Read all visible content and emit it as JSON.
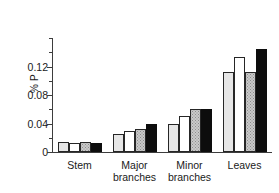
{
  "chart_data": {
    "type": "bar",
    "title": "",
    "xlabel": "",
    "ylabel": "% P",
    "ylim": [
      0,
      0.16
    ],
    "grid": false,
    "legend": "none",
    "categories": [
      "Stem",
      "Major\nbranches",
      "Minor\nbranches",
      "Leaves"
    ],
    "ytick_labels": [
      "0",
      "0.04",
      "0.08",
      "0.12"
    ],
    "ytick_values": [
      0,
      0.04,
      0.08,
      0.12
    ],
    "yminor_values": [
      0.02,
      0.06,
      0.1,
      0.14,
      0.16
    ],
    "series": [
      {
        "name": "series-1",
        "color": "#e6e6e6",
        "fill": "light-gray",
        "values": [
          0.014,
          0.025,
          0.04,
          0.112
        ]
      },
      {
        "name": "series-2",
        "color": "#ffffff",
        "fill": "white",
        "values": [
          0.012,
          0.029,
          0.05,
          0.134
        ]
      },
      {
        "name": "series-3",
        "color": "#c9c9c9",
        "fill": "stipple",
        "values": [
          0.014,
          0.033,
          0.06,
          0.112
        ]
      },
      {
        "name": "series-4",
        "color": "#0d0d0d",
        "fill": "black",
        "values": [
          0.012,
          0.039,
          0.06,
          0.144
        ]
      }
    ]
  },
  "axis": {
    "y_label_text": "% P"
  }
}
